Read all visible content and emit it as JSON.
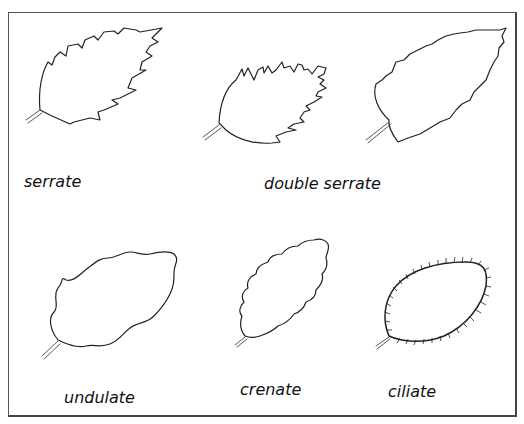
{
  "diagram": {
    "items": [
      {
        "id": "serrate",
        "label": "serrate"
      },
      {
        "id": "double-serrate",
        "label": "double serrate"
      },
      {
        "id": "undulate",
        "label": "undulate"
      },
      {
        "id": "crenate",
        "label": "crenate"
      },
      {
        "id": "ciliate",
        "label": "ciliate"
      }
    ]
  }
}
